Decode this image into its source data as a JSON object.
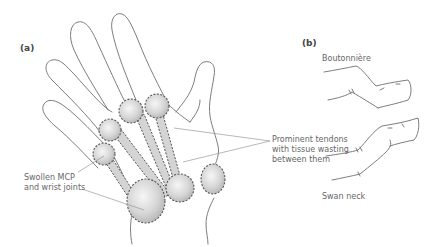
{
  "figure": {
    "panel_a": {
      "label": "(a)",
      "annotations": {
        "tendons_line1": "Prominent tendons",
        "tendons_line2": "with tissue wasting",
        "tendons_line3": "between them",
        "joints_line1": "Swollen MCP",
        "joints_line2": "and wrist joints"
      }
    },
    "panel_b": {
      "label": "(b)",
      "deformities": [
        {
          "name": "Boutonnière"
        },
        {
          "name": "Swan neck"
        }
      ]
    },
    "colors": {
      "outline": "#6e6e6e",
      "joint_fill_light": "#f4f4f4",
      "joint_fill_dark": "#b8b8b8",
      "joint_border": "#555555",
      "text": "#666666"
    }
  }
}
